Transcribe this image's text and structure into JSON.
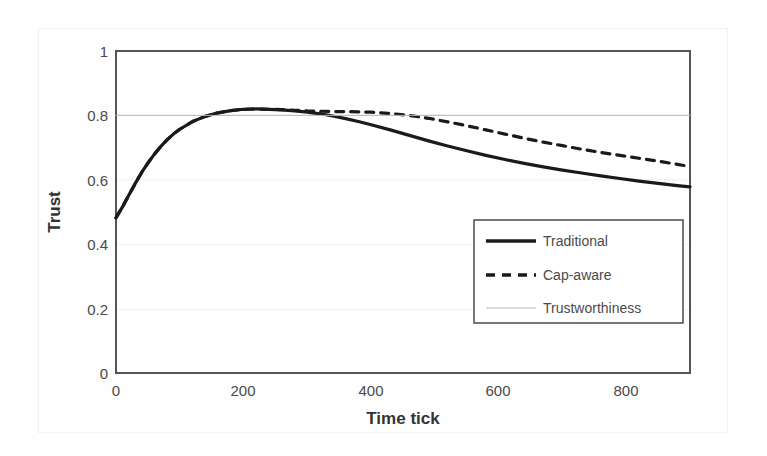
{
  "chart_data": {
    "type": "line",
    "title": "",
    "xlabel": "Time tick",
    "ylabel": "Trust",
    "xlim": [
      0,
      900
    ],
    "ylim": [
      0,
      1
    ],
    "xticks": [
      "0",
      "200",
      "400",
      "600",
      "800"
    ],
    "xtick_values": [
      0,
      200,
      400,
      600,
      800
    ],
    "yticks": [
      "0",
      "0.2",
      "0.4",
      "0.6",
      "0.8",
      "1"
    ],
    "ytick_values": [
      0,
      0.2,
      0.4,
      0.6,
      0.8,
      1
    ],
    "grid": true,
    "legend_position": "center-right",
    "series": [
      {
        "name": "Traditional",
        "style": "solid",
        "color": "#1a1a1a",
        "width": 3.2,
        "x": [
          0,
          10,
          20,
          30,
          40,
          50,
          60,
          70,
          80,
          90,
          100,
          120,
          140,
          160,
          180,
          200,
          220,
          240,
          260,
          280,
          300,
          320,
          340,
          360,
          380,
          400,
          430,
          460,
          490,
          520,
          550,
          580,
          610,
          640,
          670,
          700,
          730,
          760,
          790,
          820,
          850,
          880,
          900
        ],
        "y": [
          0.482,
          0.515,
          0.552,
          0.588,
          0.622,
          0.652,
          0.679,
          0.703,
          0.724,
          0.742,
          0.757,
          0.781,
          0.797,
          0.808,
          0.815,
          0.819,
          0.82,
          0.819,
          0.817,
          0.814,
          0.81,
          0.805,
          0.798,
          0.79,
          0.781,
          0.771,
          0.755,
          0.738,
          0.721,
          0.705,
          0.69,
          0.676,
          0.663,
          0.651,
          0.64,
          0.63,
          0.621,
          0.612,
          0.604,
          0.596,
          0.589,
          0.582,
          0.578
        ]
      },
      {
        "name": "Cap-aware",
        "style": "dashed",
        "color": "#1a1a1a",
        "width": 3.2,
        "x": [
          0,
          10,
          20,
          30,
          40,
          50,
          60,
          70,
          80,
          90,
          100,
          120,
          140,
          160,
          180,
          200,
          220,
          240,
          260,
          280,
          300,
          320,
          340,
          360,
          380,
          400,
          430,
          460,
          490,
          520,
          550,
          580,
          610,
          640,
          670,
          700,
          730,
          760,
          790,
          820,
          850,
          880,
          900
        ],
        "y": [
          0.482,
          0.515,
          0.552,
          0.588,
          0.622,
          0.652,
          0.679,
          0.703,
          0.724,
          0.742,
          0.757,
          0.781,
          0.797,
          0.808,
          0.815,
          0.819,
          0.82,
          0.819,
          0.818,
          0.816,
          0.814,
          0.813,
          0.812,
          0.812,
          0.811,
          0.81,
          0.806,
          0.8,
          0.791,
          0.78,
          0.768,
          0.755,
          0.742,
          0.729,
          0.717,
          0.706,
          0.695,
          0.685,
          0.676,
          0.667,
          0.658,
          0.648,
          0.641
        ]
      },
      {
        "name": "Trustworthiness",
        "style": "thin-solid",
        "color": "#b8b8b8",
        "width": 1,
        "x": [
          0,
          900
        ],
        "y": [
          0.8,
          0.8
        ]
      }
    ]
  },
  "legend": {
    "items": [
      {
        "label": "Traditional",
        "style": "solid"
      },
      {
        "label": "Cap-aware",
        "style": "dashed"
      },
      {
        "label": "Trustworthiness",
        "style": "thin-solid"
      }
    ]
  },
  "axes": {
    "y_title": "Trust",
    "x_title": "Time tick"
  }
}
